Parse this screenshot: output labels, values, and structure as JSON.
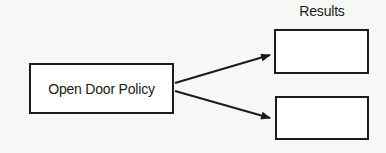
{
  "diagram": {
    "type": "flow",
    "source": {
      "label": "Open Door Policy"
    },
    "results_heading": "Results",
    "results": [
      {
        "label": ""
      },
      {
        "label": ""
      }
    ],
    "edges": [
      {
        "from": "source",
        "to": "results.0",
        "style": "arrow"
      },
      {
        "from": "source",
        "to": "results.1",
        "style": "arrow"
      }
    ],
    "colors": {
      "background": "#f7f7f6",
      "stroke": "#1c1c1c",
      "box_fill": "#ffffff"
    }
  }
}
